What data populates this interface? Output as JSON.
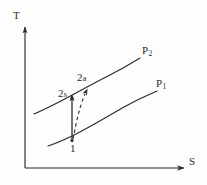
{
  "figure": {
    "kind": "ts-diagram",
    "background_color": "#fdfdfd",
    "stroke_color": "#2b2b2b",
    "text_color": "#2b2b2b"
  },
  "axes": {
    "vertical": {
      "label": "T",
      "name": "temperature-axis",
      "arrow": "up",
      "x": 25,
      "y_top": 25,
      "y_bottom": 168
    },
    "horizontal": {
      "label": "S",
      "name": "entropy-axis",
      "arrow": "right",
      "y": 168,
      "x_left": 25,
      "x_right": 186
    }
  },
  "curves": [
    {
      "name": "isobar-p2",
      "label": "P",
      "subscript": "2",
      "style": "solid",
      "path": "M 34,114 C 58,104 84,88 108,76 C 122,69 132,63 140,58"
    },
    {
      "name": "isobar-p1",
      "label": "P",
      "subscript": "1",
      "style": "solid",
      "path": "M 48,146 C 72,138 98,122 124,107 C 140,98 150,94 157,91"
    }
  ],
  "processes": [
    {
      "name": "isentropic-compression",
      "from": "1",
      "to": "2s",
      "style": "solid",
      "arrow": "up",
      "path": "M 72,140 L 72,97"
    },
    {
      "name": "actual-compression",
      "from": "1",
      "to": "2a",
      "style": "dashed",
      "arrow": "up",
      "path": "M 73,140 C 76,124 80,108 86,92"
    }
  ],
  "points": [
    {
      "name": "state-point-1",
      "label": "1",
      "x": 72,
      "y": 140
    },
    {
      "name": "state-point-2s",
      "label": "2",
      "sub": "s",
      "x": 72,
      "y": 96
    },
    {
      "name": "state-point-2a",
      "label": "2",
      "sub": "a",
      "x": 87,
      "y": 89
    }
  ],
  "labels": {
    "t_axis": "T",
    "s_axis": "S",
    "p2_base": "P",
    "p2_sub": "2",
    "p1_base": "P",
    "p1_sub": "1",
    "point1": "1",
    "point2s_base": "2",
    "point2s_sub": "s",
    "point2a_base": "2",
    "point2a_sub": "a"
  }
}
